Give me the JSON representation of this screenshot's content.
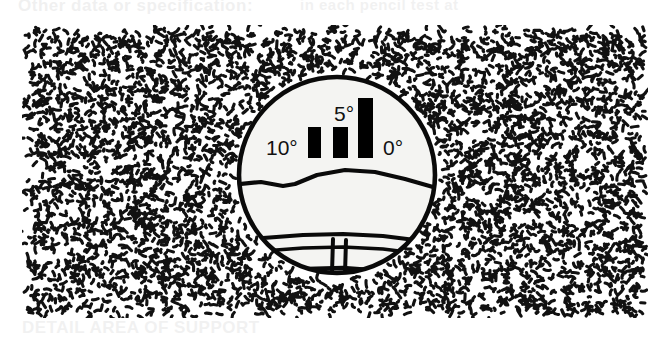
{
  "figure": {
    "name": "sight-picture-illustration",
    "caption_top": "Other data or specification:",
    "caption_top_right": "in each  pencil  test  at",
    "caption_bottom": "DETAIL   AREA  OF  SUPPORT"
  },
  "background": {
    "texture": "stipple-texture",
    "ink_color": "#000000",
    "paper_color": "#ffffff"
  },
  "scope": {
    "name": "scope-view",
    "outline_color": "#000000",
    "field_color": "#f5f5f3",
    "reticle_color": "#000000",
    "scale_labels": [
      {
        "text": "10°",
        "value": 10,
        "x": 33,
        "y": 84
      },
      {
        "text": "5°",
        "value": 5,
        "x": 101,
        "y": 50
      },
      {
        "text": "0°",
        "value": 0,
        "x": 150,
        "y": 84
      }
    ],
    "bars": [
      {
        "name": "range-bar-10",
        "x": 75,
        "y": 56,
        "w": 13,
        "h": 31
      },
      {
        "name": "range-bar-5",
        "x": 100,
        "y": 56,
        "w": 15,
        "h": 31
      },
      {
        "name": "range-bar-0",
        "x": 125,
        "y": 27,
        "w": 15,
        "h": 60
      }
    ],
    "horizon_lines": [
      {
        "name": "ridge-line-upper"
      },
      {
        "name": "ridge-line-lower"
      },
      {
        "name": "road-line-upper"
      },
      {
        "name": "road-line-lower"
      },
      {
        "name": "base-line"
      }
    ],
    "center_post": {
      "name": "center-post-divider"
    }
  }
}
